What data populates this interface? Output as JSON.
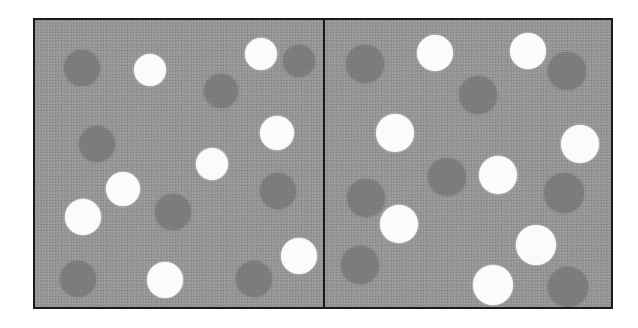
{
  "figure": {
    "name": "two-panel-dot-array-stimulus",
    "background_color": "#ffffff",
    "border_color": "#1a1a1a",
    "panel_background_color": "#969696",
    "white_dot_color": "#fbfbfb",
    "dark_dot_color": "#7c7c7c",
    "divider_color": "#1a1a1a",
    "frame": {
      "x": 33,
      "y": 18,
      "width": 580,
      "height": 291
    }
  },
  "panels": [
    {
      "id": "left-panel",
      "label": "Left Panel",
      "white_dot_count": 8,
      "dark_dot_count": 9,
      "total_dot_count": 17,
      "dots": [
        {
          "type": "dark",
          "cx": 47,
          "cy": 48,
          "r": 18
        },
        {
          "type": "white",
          "cx": 115,
          "cy": 50,
          "r": 16
        },
        {
          "type": "white",
          "cx": 226,
          "cy": 34,
          "r": 16
        },
        {
          "type": "dark",
          "cx": 264,
          "cy": 41,
          "r": 16
        },
        {
          "type": "dark",
          "cx": 186,
          "cy": 71,
          "r": 17
        },
        {
          "type": "dark",
          "cx": 62,
          "cy": 124,
          "r": 18
        },
        {
          "type": "white",
          "cx": 242,
          "cy": 113,
          "r": 17
        },
        {
          "type": "white",
          "cx": 177,
          "cy": 144,
          "r": 16
        },
        {
          "type": "white",
          "cx": 88,
          "cy": 169,
          "r": 17
        },
        {
          "type": "dark",
          "cx": 243,
          "cy": 171,
          "r": 18
        },
        {
          "type": "white",
          "cx": 48,
          "cy": 197,
          "r": 18
        },
        {
          "type": "dark",
          "cx": 138,
          "cy": 192,
          "r": 18
        },
        {
          "type": "white",
          "cx": 264,
          "cy": 236,
          "r": 18
        },
        {
          "type": "dark",
          "cx": 219,
          "cy": 259,
          "r": 18
        },
        {
          "type": "dark",
          "cx": 43,
          "cy": 259,
          "r": 18
        },
        {
          "type": "white",
          "cx": 130,
          "cy": 260,
          "r": 18
        },
        {
          "type": "dark",
          "cx": 221,
          "cy": 259,
          "r": 0
        }
      ]
    },
    {
      "id": "right-panel",
      "label": "Right Panel",
      "white_dot_count": 9,
      "dark_dot_count": 9,
      "total_dot_count": 18,
      "dots": [
        {
          "type": "dark",
          "cx": 40,
          "cy": 44,
          "r": 19
        },
        {
          "type": "white",
          "cx": 110,
          "cy": 33,
          "r": 18
        },
        {
          "type": "white",
          "cx": 203,
          "cy": 31,
          "r": 18
        },
        {
          "type": "dark",
          "cx": 242,
          "cy": 51,
          "r": 19
        },
        {
          "type": "dark",
          "cx": 153,
          "cy": 75,
          "r": 19
        },
        {
          "type": "white",
          "cx": 70,
          "cy": 113,
          "r": 19
        },
        {
          "type": "white",
          "cx": 255,
          "cy": 124,
          "r": 19
        },
        {
          "type": "dark",
          "cx": 41,
          "cy": 178,
          "r": 19
        },
        {
          "type": "dark",
          "cx": 122,
          "cy": 157,
          "r": 19
        },
        {
          "type": "white",
          "cx": 173,
          "cy": 155,
          "r": 19
        },
        {
          "type": "dark",
          "cx": 239,
          "cy": 173,
          "r": 20
        },
        {
          "type": "white",
          "cx": 74,
          "cy": 204,
          "r": 19
        },
        {
          "type": "dark",
          "cx": 35,
          "cy": 245,
          "r": 19
        },
        {
          "type": "white",
          "cx": 211,
          "cy": 225,
          "r": 20
        },
        {
          "type": "white",
          "cx": 168,
          "cy": 265,
          "r": 20
        },
        {
          "type": "dark",
          "cx": 243,
          "cy": 267,
          "r": 20
        },
        {
          "type": "white",
          "cx": 253,
          "cy": 123,
          "r": 0
        },
        {
          "type": "dark",
          "cx": 240,
          "cy": 174,
          "r": 0
        }
      ]
    }
  ]
}
